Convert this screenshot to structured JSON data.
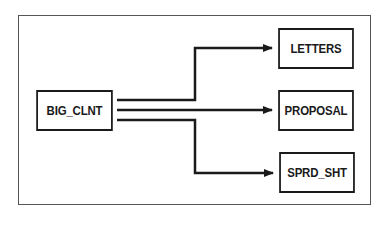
{
  "diagram": {
    "type": "flow",
    "source": {
      "id": "big_clnt",
      "label": "BIG_CLNT"
    },
    "targets": [
      {
        "id": "letters",
        "label": "LETTERS"
      },
      {
        "id": "proposal",
        "label": "PROPOSAL"
      },
      {
        "id": "sprd_sht",
        "label": "SPRD_SHT"
      }
    ],
    "edges": [
      {
        "from": "BIG_CLNT",
        "to": "LETTERS"
      },
      {
        "from": "BIG_CLNT",
        "to": "PROPOSAL"
      },
      {
        "from": "BIG_CLNT",
        "to": "SPRD_SHT"
      }
    ],
    "colors": {
      "line": "#1a1a1a",
      "frame": "#555555",
      "background": "#ffffff"
    }
  }
}
